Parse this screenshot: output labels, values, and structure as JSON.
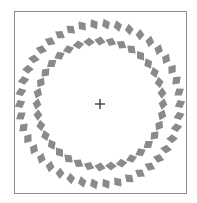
{
  "figure": {
    "type": "pinna-illusion",
    "center": [
      100,
      104
    ],
    "fixation_mark": "+",
    "element_color": "#8a8a8a",
    "frame_color": "#8c8c8c",
    "rings": [
      {
        "name": "outer",
        "radius": 80,
        "count": 42,
        "tilt_deg": 25
      },
      {
        "name": "inner",
        "radius": 63,
        "count": 36,
        "tilt_deg": -25
      }
    ]
  }
}
